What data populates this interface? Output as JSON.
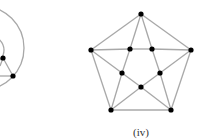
{
  "figure": {
    "caption": "(iv)",
    "caption_pos": [
      141,
      126
    ],
    "edge_color": "#a8a8a8",
    "vertex_color": "#000000",
    "edge_width": 1.3,
    "vertex_radius": 2.6
  },
  "partial_graph": {
    "outer_arc": {
      "cx": -18,
      "cy": 48,
      "r": 42
    },
    "inner_arc": {
      "cx": -10,
      "cy": 50,
      "r": 14
    },
    "vertices": [
      [
        3,
        58
      ],
      [
        13,
        76
      ]
    ],
    "edges": [
      [
        [
          3,
          58
        ],
        [
          13,
          76
        ]
      ],
      [
        [
          0,
          76
        ],
        [
          13,
          76
        ]
      ],
      [
        [
          0,
          66
        ],
        [
          3,
          58
        ]
      ]
    ]
  },
  "graph_iv": {
    "vertices": [
      [
        141,
        14
      ],
      [
        91,
        50
      ],
      [
        130,
        49
      ],
      [
        152,
        49
      ],
      [
        191,
        50
      ],
      [
        122,
        73
      ],
      [
        160,
        73
      ],
      [
        141,
        87
      ],
      [
        111,
        110
      ],
      [
        171,
        110
      ]
    ],
    "edges": [
      [
        0,
        1
      ],
      [
        0,
        4
      ],
      [
        1,
        8
      ],
      [
        4,
        9
      ],
      [
        8,
        9
      ],
      [
        1,
        2
      ],
      [
        2,
        3
      ],
      [
        3,
        4
      ],
      [
        0,
        2
      ],
      [
        0,
        3
      ],
      [
        2,
        5
      ],
      [
        3,
        6
      ],
      [
        1,
        5
      ],
      [
        4,
        6
      ],
      [
        5,
        7
      ],
      [
        6,
        7
      ],
      [
        5,
        8
      ],
      [
        6,
        9
      ],
      [
        7,
        8
      ],
      [
        7,
        9
      ]
    ]
  }
}
